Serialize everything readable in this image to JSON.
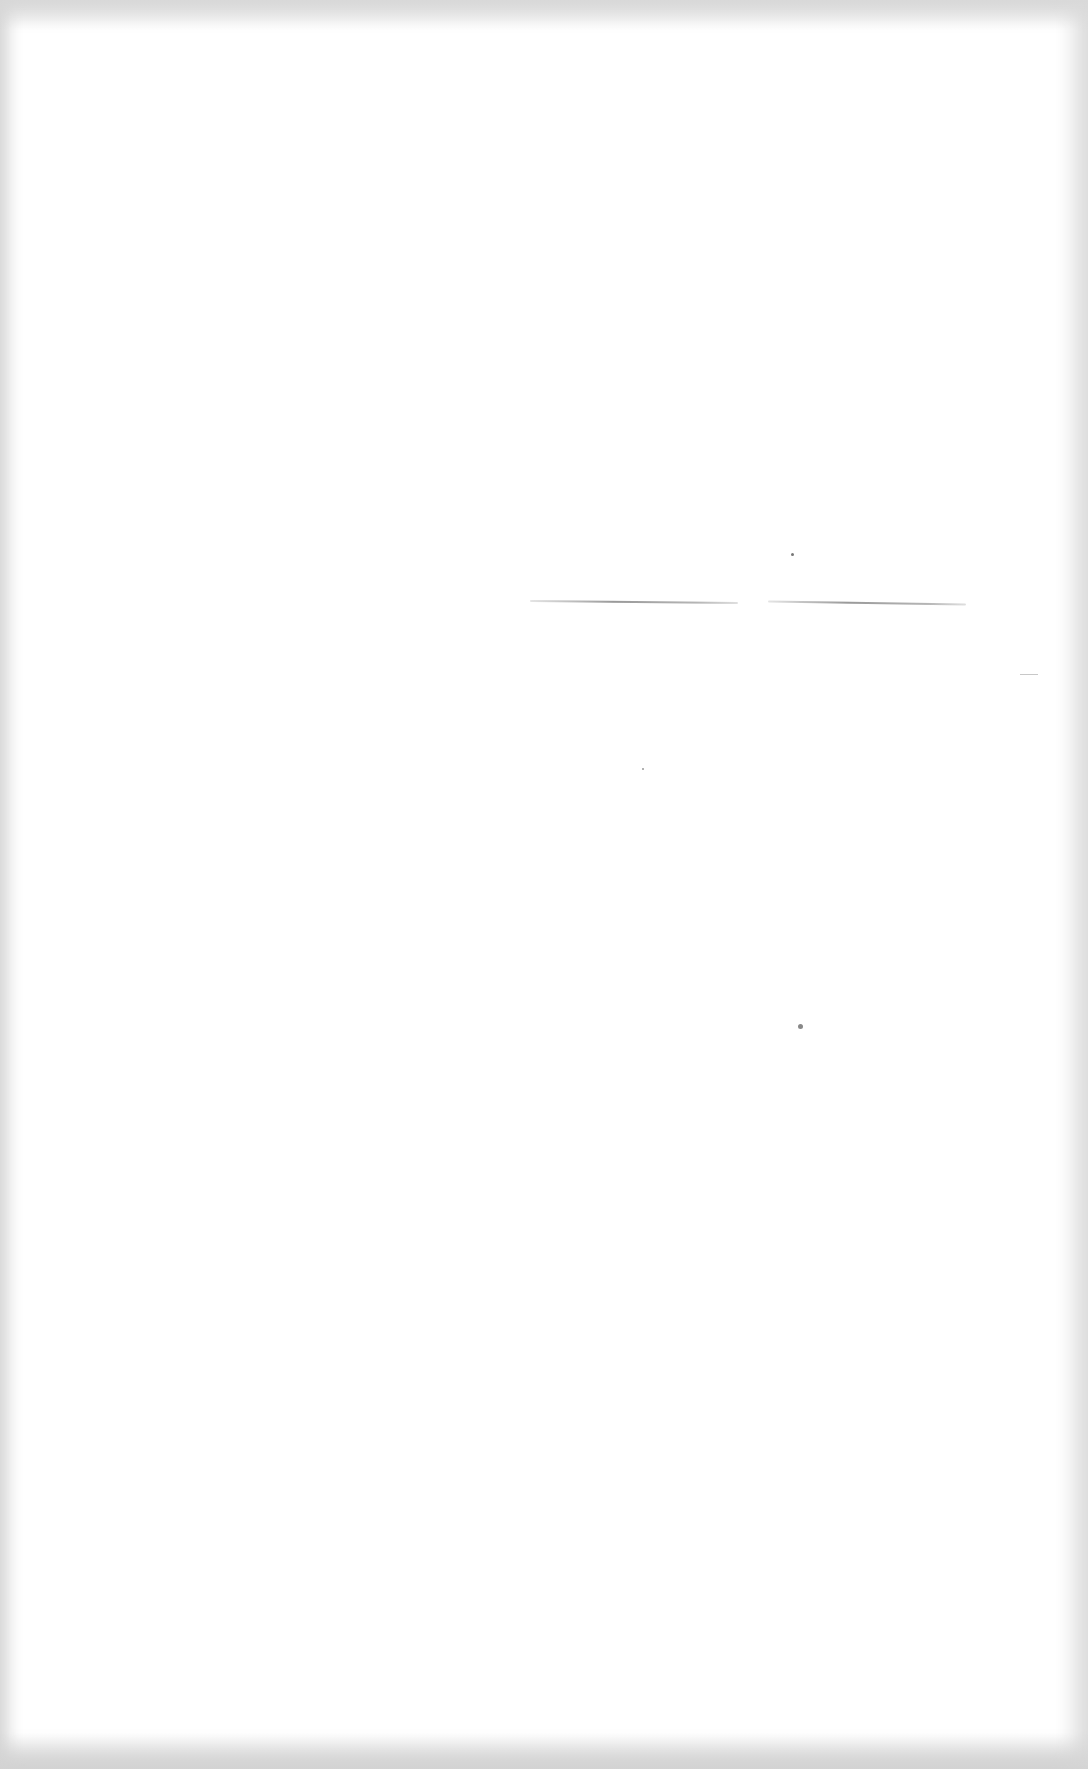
{
  "document": {
    "type": "blank-scanned-page",
    "text_content": "",
    "marks": {
      "horizontal_strokes": 2,
      "specks": 3
    },
    "colors": {
      "paper": "#ffffff",
      "scan_border": "#d8d8d8",
      "stroke": "#8a8a8a"
    }
  }
}
